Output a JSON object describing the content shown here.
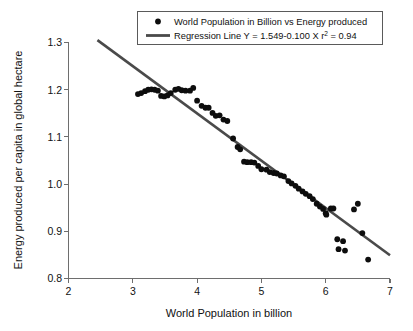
{
  "chart_data": {
    "type": "scatter",
    "title": "",
    "xlabel": "World Population in billion",
    "ylabel": "Energy produced per capita in global hectare",
    "xlim": [
      2,
      7
    ],
    "ylim": [
      0.8,
      1.3
    ],
    "xticks": [
      "2",
      "3",
      "4",
      "5",
      "6",
      "7"
    ],
    "yticks": [
      "0.8",
      "0.9",
      "1.0",
      "1.1",
      "1.2",
      "1.3"
    ],
    "grid": false,
    "legend_position": "top-center",
    "legend": [
      {
        "marker": "dot",
        "label": "World Population in Billion vs Energy produced"
      },
      {
        "marker": "line",
        "label_main": "Regression Line Y = 1.549-0.100 X r",
        "label_sup": "2",
        "label_tail": " = 0.94",
        "label": "Regression Line Y = 1.549-0.100 X r ² = 0.94"
      }
    ],
    "series": [
      {
        "name": "World Population in Billion vs Energy produced",
        "marker": "dot",
        "color": "#0d0d0d",
        "points": [
          [
            3.08,
            1.19
          ],
          [
            3.13,
            1.192
          ],
          [
            3.19,
            1.196
          ],
          [
            3.24,
            1.199
          ],
          [
            3.29,
            1.2
          ],
          [
            3.34,
            1.199
          ],
          [
            3.39,
            1.197
          ],
          [
            3.44,
            1.186
          ],
          [
            3.49,
            1.185
          ],
          [
            3.54,
            1.187
          ],
          [
            3.59,
            1.192
          ],
          [
            3.66,
            1.199
          ],
          [
            3.71,
            1.201
          ],
          [
            3.76,
            1.198
          ],
          [
            3.82,
            1.197
          ],
          [
            3.89,
            1.197
          ],
          [
            3.94,
            1.203
          ],
          [
            4.0,
            1.176
          ],
          [
            4.07,
            1.165
          ],
          [
            4.13,
            1.161
          ],
          [
            4.18,
            1.161
          ],
          [
            4.24,
            1.15
          ],
          [
            4.29,
            1.144
          ],
          [
            4.35,
            1.145
          ],
          [
            4.41,
            1.136
          ],
          [
            4.47,
            1.133
          ],
          [
            4.56,
            1.096
          ],
          [
            4.63,
            1.078
          ],
          [
            4.67,
            1.073
          ],
          [
            4.73,
            1.047
          ],
          [
            4.78,
            1.046
          ],
          [
            4.84,
            1.046
          ],
          [
            4.89,
            1.045
          ],
          [
            4.95,
            1.038
          ],
          [
            5.0,
            1.031
          ],
          [
            5.08,
            1.03
          ],
          [
            5.13,
            1.025
          ],
          [
            5.19,
            1.023
          ],
          [
            5.24,
            1.022
          ],
          [
            5.3,
            1.018
          ],
          [
            5.35,
            1.016
          ],
          [
            5.42,
            1.006
          ],
          [
            5.47,
            1.001
          ],
          [
            5.53,
            0.996
          ],
          [
            5.58,
            0.99
          ],
          [
            5.64,
            0.984
          ],
          [
            5.69,
            0.979
          ],
          [
            5.75,
            0.974
          ],
          [
            5.8,
            0.968
          ],
          [
            5.86,
            0.958
          ],
          [
            5.91,
            0.952
          ],
          [
            5.96,
            0.947
          ],
          [
            6.0,
            0.938
          ],
          [
            6.01,
            0.935
          ],
          [
            6.08,
            0.948
          ],
          [
            6.12,
            0.948
          ],
          [
            6.18,
            0.883
          ],
          [
            6.2,
            0.862
          ],
          [
            6.27,
            0.879
          ],
          [
            6.3,
            0.859
          ],
          [
            6.44,
            0.946
          ],
          [
            6.5,
            0.958
          ],
          [
            6.57,
            0.896
          ],
          [
            6.66,
            0.84
          ]
        ]
      }
    ],
    "regression": {
      "name": "Regression Line",
      "equation": "Y = 1.549-0.100 X",
      "intercept": 1.549,
      "slope": -0.1,
      "r_squared": 0.94,
      "color": "#4a4a4a",
      "x_start": 2.45,
      "x_end": 7.0
    }
  }
}
